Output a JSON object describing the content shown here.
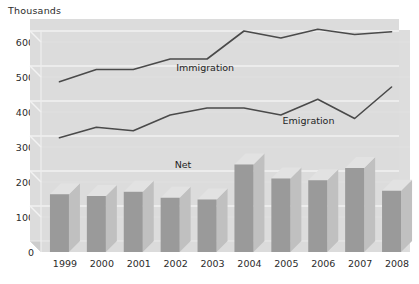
{
  "chart_data": {
    "type": "bar",
    "title": "Thousands",
    "xlabel": "",
    "ylabel": "Thousands",
    "categories": [
      "1999",
      "2000",
      "2001",
      "2002",
      "2003",
      "2004",
      "2005",
      "2006",
      "2007",
      "2008"
    ],
    "ylim": [
      0,
      650
    ],
    "yticks": [
      0,
      100,
      200,
      300,
      400,
      500,
      600
    ],
    "ytick_labels": [
      "0",
      "100",
      "200",
      "300",
      "400",
      "500",
      "600"
    ],
    "grid": true,
    "legend_position": "inline-labels",
    "style": "3d-bars-with-overlaid-lines",
    "series": [
      {
        "name": "Immigration",
        "type": "line",
        "label": "Immigration",
        "values": [
          455,
          490,
          490,
          520,
          520,
          600,
          580,
          605,
          590,
          598
        ]
      },
      {
        "name": "Emigration",
        "type": "line",
        "label": "Emigration",
        "values": [
          295,
          325,
          315,
          360,
          380,
          380,
          360,
          405,
          350,
          440
        ]
      },
      {
        "name": "Net",
        "type": "bar",
        "label": "Net",
        "values": [
          165,
          160,
          172,
          155,
          150,
          250,
          210,
          205,
          240,
          175
        ]
      }
    ],
    "annotations": [
      {
        "text": "Immigration",
        "x": 2002.8,
        "y": 497
      },
      {
        "text": "Emigration",
        "x": 2005.6,
        "y": 345
      },
      {
        "text": "Net",
        "x": 2002.2,
        "y": 220
      }
    ]
  },
  "colors": {
    "plot_background": "#dcdcdc",
    "grid_line": "#f2f2f2",
    "bar_face": "#9a9a9a",
    "bar_top": "#e2e2e2",
    "bar_side": "#c0c0c0",
    "line": "#4a4a4a",
    "text": "#2b2b2b",
    "page_background": "#ffffff"
  }
}
